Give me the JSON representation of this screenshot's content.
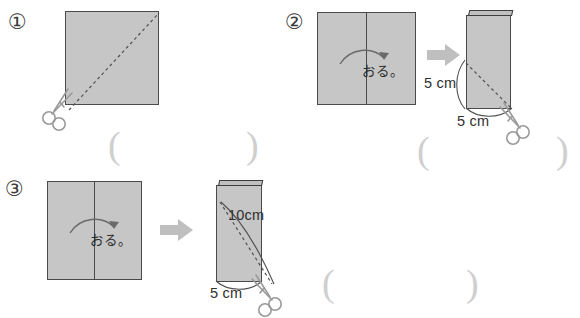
{
  "page": {
    "background_color": "#ffffff",
    "paper_fill": "#c6c6c6",
    "paper_stroke": "#4a4a4a",
    "arrow_color": "#bfbfbf",
    "paren_color": "#cfcfcf"
  },
  "problems": [
    {
      "number": "①",
      "figures": [
        {
          "kind": "square",
          "cut": "diagonal-dashed",
          "scissors": "bottom-left",
          "labels": []
        }
      ],
      "fold_label": "",
      "answer_blank": {
        "open": "(",
        "close": ")"
      }
    },
    {
      "number": "②",
      "figures": [
        {
          "kind": "square-with-foldline",
          "fold_label": "おる。",
          "labels": []
        },
        {
          "kind": "folded-rectangle",
          "cut": "diagonal-dashed",
          "scissors": "bottom-right",
          "labels": [
            {
              "text": "5 cm",
              "position": "left-side"
            },
            {
              "text": "5 cm",
              "position": "bottom"
            }
          ]
        }
      ],
      "transition_arrow": "arrow-right",
      "answer_blank": {
        "open": "(",
        "close": ")"
      }
    },
    {
      "number": "③",
      "figures": [
        {
          "kind": "square-with-foldline",
          "fold_label": "おる。",
          "labels": []
        },
        {
          "kind": "folded-rectangle",
          "cut": "diagonal-dashed",
          "scissors": "bottom-right",
          "labels": [
            {
              "text": "10cm",
              "position": "diagonal"
            },
            {
              "text": "5 cm",
              "position": "bottom"
            }
          ]
        }
      ],
      "transition_arrow": "arrow-right",
      "answer_blank": {
        "open": "(",
        "close": ")"
      }
    }
  ],
  "icons": {
    "scissors": "scissors-icon",
    "arrow_right": "arrow-right-icon",
    "fold_arrow": "curved-fold-arrow-icon"
  }
}
